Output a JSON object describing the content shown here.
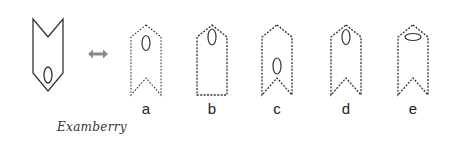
{
  "question": {
    "type": "mirror-image",
    "figure": {
      "shape": "chevron-pentagon-pointing-down",
      "notch": "top",
      "oval": {
        "position": "bottom",
        "orientation": "vertical"
      },
      "stroke": "solid"
    },
    "arrow": {
      "symbol": "double-headed-arrow",
      "color": "#8a8a8a"
    }
  },
  "options": [
    {
      "label": "a",
      "shape": "chevron-pointing-up",
      "notch": "bottom",
      "oval": {
        "position": "top",
        "orientation": "vertical"
      }
    },
    {
      "label": "b",
      "shape": "pentagon-pointing-up",
      "notch": "none",
      "oval": {
        "position": "top",
        "orientation": "vertical"
      }
    },
    {
      "label": "c",
      "shape": "chevron-pointing-up",
      "notch": "bottom",
      "oval": {
        "position": "bottom",
        "orientation": "vertical"
      }
    },
    {
      "label": "d",
      "shape": "chevron-pointing-up",
      "notch": "bottom",
      "oval": {
        "position": "top",
        "orientation": "vertical"
      }
    },
    {
      "label": "e",
      "shape": "chevron-pointing-up",
      "notch": "bottom",
      "oval": {
        "position": "top",
        "orientation": "horizontal"
      }
    }
  ],
  "watermark": "Examberry",
  "colors": {
    "stroke": "#333333",
    "arrow": "#8a8a8a",
    "background": "#ffffff"
  }
}
